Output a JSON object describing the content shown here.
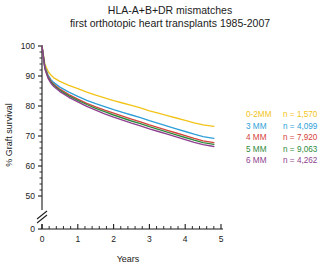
{
  "chart_data": {
    "type": "line",
    "title": "HLA-A+B+DR mismatches\nfirst orthotopic heart transplants 1985-2007",
    "title_lines": [
      "HLA-A+B+DR mismatches",
      "first orthotopic heart transplants 1985-2007"
    ],
    "xlabel": "Years",
    "ylabel": "% Graft survival",
    "xlim": [
      0,
      5
    ],
    "ylim": [
      0,
      100
    ],
    "y_axis_break": true,
    "y_break_between": [
      0,
      50
    ],
    "grid": false,
    "legend_position": "right-middle",
    "xticks": [
      0,
      1,
      2,
      3,
      4,
      5
    ],
    "xtick_labels": [
      "0",
      "1",
      "2",
      "3",
      "4",
      "5"
    ],
    "x_minor_ticks_per_major": 5,
    "yticks": [
      0,
      50,
      60,
      70,
      80,
      90,
      100
    ],
    "ytick_labels": [
      "0",
      "50",
      "60",
      "70",
      "80",
      "90",
      "100"
    ],
    "y_minor_ticks": [
      52,
      54,
      56,
      58,
      62,
      64,
      66,
      68,
      72,
      74,
      76,
      78,
      82,
      84,
      86,
      88,
      92,
      94,
      96,
      98
    ],
    "x": [
      0,
      0.08,
      0.17,
      0.25,
      0.33,
      0.5,
      0.75,
      1.0,
      1.25,
      1.5,
      1.75,
      2.0,
      2.25,
      2.5,
      2.75,
      3.0,
      3.25,
      3.5,
      3.75,
      4.0,
      4.25,
      4.5,
      4.8
    ],
    "series": [
      {
        "name": "0-2MM",
        "label": "0-2MM",
        "n_label": "n =  1,570",
        "n": 1570,
        "color": "#f2c419",
        "values": [
          100,
          94.0,
          91.5,
          90.3,
          89.4,
          88.2,
          86.9,
          85.8,
          84.6,
          83.6,
          82.7,
          81.8,
          81.0,
          80.2,
          79.4,
          78.4,
          77.6,
          76.8,
          76.0,
          75.2,
          74.4,
          73.7,
          73.2
        ]
      },
      {
        "name": "3 MM",
        "label": "3 MM",
        "n_label": "n =  4,099",
        "n": 4099,
        "color": "#2e9fd8",
        "values": [
          100,
          93.2,
          90.3,
          88.8,
          87.8,
          86.3,
          84.6,
          83.2,
          81.9,
          80.8,
          79.8,
          78.8,
          77.9,
          77.0,
          76.1,
          75.1,
          74.2,
          73.3,
          72.4,
          71.5,
          70.6,
          69.8,
          69.2
        ]
      },
      {
        "name": "4 MM",
        "label": "4 MM",
        "n_label": "n =  7,920",
        "n": 7920,
        "color": "#d4433c",
        "values": [
          100,
          92.8,
          89.8,
          88.3,
          87.2,
          85.6,
          83.8,
          82.3,
          80.9,
          79.7,
          78.6,
          77.6,
          76.6,
          75.6,
          74.7,
          73.7,
          72.8,
          71.9,
          71.0,
          70.1,
          69.2,
          68.4,
          67.8
        ]
      },
      {
        "name": "5 MM",
        "label": "5 MM",
        "n_label": "n =  9,063",
        "n": 9063,
        "color": "#2e8b3d",
        "values": [
          100,
          92.6,
          89.5,
          88.0,
          86.9,
          85.2,
          83.4,
          81.9,
          80.5,
          79.2,
          78.1,
          77.0,
          76.0,
          75.0,
          74.1,
          73.1,
          72.2,
          71.3,
          70.4,
          69.5,
          68.6,
          67.8,
          67.2
        ]
      },
      {
        "name": "6 MM",
        "label": "6 MM",
        "n_label": "n =  4,262",
        "n": 4262,
        "color": "#8e3f8e",
        "values": [
          100,
          92.4,
          89.2,
          87.6,
          86.5,
          84.8,
          82.9,
          81.4,
          79.9,
          78.6,
          77.4,
          76.3,
          75.3,
          74.3,
          73.4,
          72.4,
          71.5,
          70.6,
          69.7,
          68.8,
          67.9,
          67.1,
          66.5
        ]
      }
    ]
  },
  "legend": {
    "rows": [
      {
        "label": "0-2MM",
        "n_label": "n =  1,570",
        "color": "#f2c419"
      },
      {
        "label": "3 MM",
        "n_label": "n =  4,099",
        "color": "#2e9fd8"
      },
      {
        "label": "4 MM",
        "n_label": "n =  7,920",
        "color": "#d4433c"
      },
      {
        "label": "5 MM",
        "n_label": "n =  9,063",
        "color": "#2e8b3d"
      },
      {
        "label": "6 MM",
        "n_label": "n =  4,262",
        "color": "#8e3f8e"
      }
    ]
  }
}
